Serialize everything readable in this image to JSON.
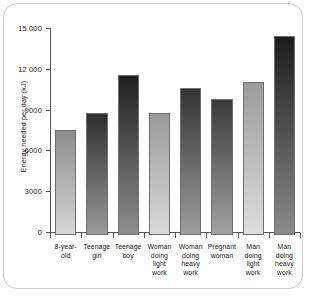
{
  "chart_data": {
    "type": "bar",
    "title": "",
    "xlabel": "",
    "ylabel": "Energy needed per day (kJ)",
    "ylim": [
      0,
      15000
    ],
    "grid": false,
    "legend": false,
    "y_ticks": [
      0,
      3000,
      6000,
      9000,
      12000,
      15000
    ],
    "y_tick_labels": [
      "0",
      "3000",
      "6000",
      "9000",
      "12 000",
      "15 000"
    ],
    "categories": [
      "8-year-\nold",
      "Teenage\ngirl",
      "Teenage\nboy",
      "Woman\ndoing\nlight\nwork",
      "Woman\ndoing\nheavy\nwork",
      "Pregnant\nwoman",
      "Man\ndoing\nlight\nwork",
      "Man\ndoing\nheavy\nwork"
    ],
    "values": [
      7750,
      9000,
      11800,
      9000,
      10800,
      10000,
      11250,
      14600
    ],
    "bar_shades": [
      {
        "top": "#8d8d8d",
        "bottom": "#d6d6d6"
      },
      {
        "top": "#2e2e2e",
        "bottom": "#9a9a9a"
      },
      {
        "top": "#1f1f1f",
        "bottom": "#8f8f8f"
      },
      {
        "top": "#9a9a9a",
        "bottom": "#dadada"
      },
      {
        "top": "#333333",
        "bottom": "#9e9e9e"
      },
      {
        "top": "#3a3a3a",
        "bottom": "#a2a2a2"
      },
      {
        "top": "#9b9b9b",
        "bottom": "#dedede"
      },
      {
        "top": "#1c1c1c",
        "bottom": "#8b8b8b"
      }
    ],
    "axis_color": "#555555",
    "frame_color": "#c9c9c9",
    "text_color": "#1a1a1a"
  }
}
